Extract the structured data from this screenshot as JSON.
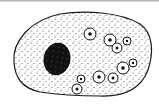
{
  "diagram": {
    "colors": {
      "background": "#ffffff",
      "outline": "#1a1a1a",
      "cytoplasm_stipple": "#333333",
      "nucleus": "#111111",
      "top_bar": "#b0b0b0"
    },
    "cell": {
      "shape": "ellipse"
    },
    "nucleus": {
      "cx": 57,
      "cy": 59,
      "rx": 13,
      "ry": 16
    },
    "vacuoles": [
      {
        "cx": 90,
        "cy": 34,
        "r": 6
      },
      {
        "cx": 110,
        "cy": 40,
        "r": 6
      },
      {
        "cx": 127,
        "cy": 41,
        "r": 4
      },
      {
        "cx": 117,
        "cy": 48,
        "r": 5
      },
      {
        "cx": 133,
        "cy": 63,
        "r": 4
      },
      {
        "cx": 123,
        "cy": 68,
        "r": 6
      },
      {
        "cx": 99,
        "cy": 77,
        "r": 6
      },
      {
        "cx": 113,
        "cy": 78,
        "r": 5
      },
      {
        "cx": 81,
        "cy": 79,
        "r": 4
      },
      {
        "cx": 77,
        "cy": 89,
        "r": 5
      }
    ]
  }
}
